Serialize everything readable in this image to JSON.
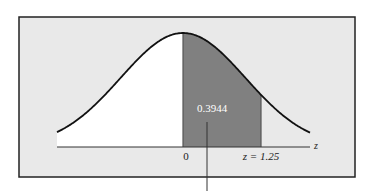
{
  "chart_data": {
    "type": "area",
    "title": "",
    "xlabel": "z",
    "ylabel": "",
    "distribution": "standard normal",
    "shaded_region": {
      "from": 0,
      "to": 1.25,
      "area": 0.3944
    },
    "tick_labels": [
      "0",
      "z = 1.25"
    ],
    "area_label": "0.3944",
    "xlim": [
      -3.5,
      3.5
    ],
    "grid": false,
    "legend": null
  },
  "labels": {
    "area": "0.3944",
    "zero": "0",
    "z_value": "z = 1.25",
    "axis": "z"
  },
  "colors": {
    "background": "#e9e9e9",
    "frame": "#222222",
    "shade": "#808080",
    "curve": "#111111",
    "under_curve_unshaded": "#ffffff",
    "area_label": "#ffffff"
  }
}
